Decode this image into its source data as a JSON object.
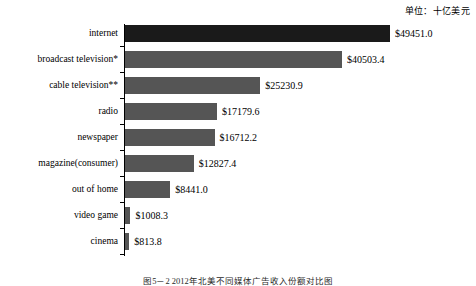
{
  "unit_note": "单位：十亿美元",
  "caption": "图5－2 2012年北美不同媒体广告收入份额对比图",
  "chart_data": {
    "type": "bar",
    "orientation": "horizontal",
    "title": "",
    "subtitle": "",
    "xlabel": "",
    "ylabel": "",
    "unit_note": "单位：十亿美元",
    "grid": false,
    "legend": "none",
    "axis_line": "vertical-left",
    "categories": [
      "internet",
      "broadcast television*",
      "cable television**",
      "radio",
      "newspaper",
      "magazine(consumer)",
      "out of home",
      "video game",
      "cinema"
    ],
    "values": [
      49451.0,
      40503.4,
      25230.9,
      17179.6,
      16712.2,
      12827.4,
      8441.0,
      1008.3,
      813.8
    ],
    "value_labels": [
      "$49451.0",
      "$40503.4",
      "$25230.9",
      "$17179.6",
      "$16712.2",
      "$12827.4",
      "$8441.0",
      "$1008.3",
      "$813.8"
    ],
    "xlim": [
      0,
      49451.0
    ],
    "colors": {
      "bar_default": "#555555",
      "bar_highlight": "#1a1a1a",
      "background": "#ffffff",
      "axis": "#000000",
      "text": "#000000"
    },
    "highlight_index": 0
  }
}
